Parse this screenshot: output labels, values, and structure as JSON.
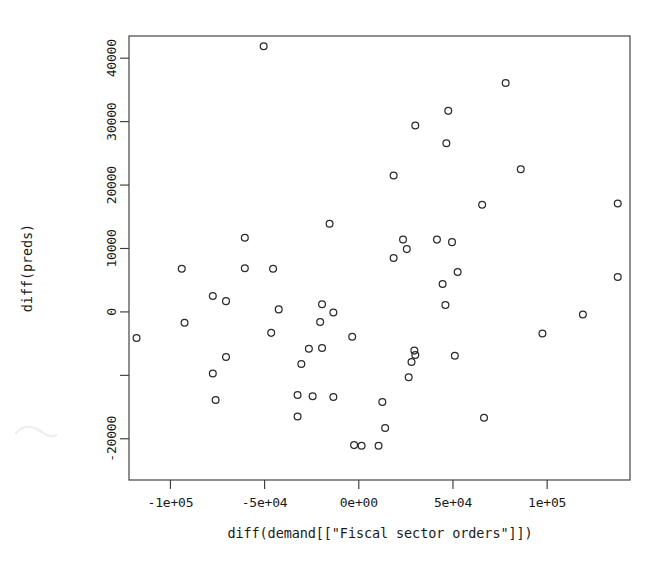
{
  "chart_data": {
    "type": "scatter",
    "title": "",
    "xlabel": "diff(demand[[\"Fiscal sector orders\"]])",
    "ylabel": "diff(preds)",
    "xlim": [
      -122000,
      144000
    ],
    "ylim": [
      -26500,
      43500
    ],
    "grid": false,
    "legend": "none",
    "marker": "open-circle",
    "marker_color": "#2b2b2b",
    "xticks": [
      -100000,
      -50000,
      0,
      50000,
      100000
    ],
    "xticklabels": [
      "-1e+05",
      "-5e+04",
      "0e+00",
      "5e+04",
      "1e+05"
    ],
    "yticks": [
      -20000,
      -10000,
      0,
      10000,
      20000,
      30000,
      40000
    ],
    "yticklabels": [
      "-20000",
      "",
      "0",
      "10000",
      "20000",
      "30000",
      "40000"
    ],
    "points": [
      {
        "x": -50500,
        "y": 41900
      },
      {
        "x": 78000,
        "y": 36100
      },
      {
        "x": 47500,
        "y": 31700
      },
      {
        "x": 30000,
        "y": 29400
      },
      {
        "x": 46500,
        "y": 26600
      },
      {
        "x": 86000,
        "y": 22500
      },
      {
        "x": 18500,
        "y": 21500
      },
      {
        "x": 65500,
        "y": 16900
      },
      {
        "x": 137500,
        "y": 17100
      },
      {
        "x": -15500,
        "y": 13900
      },
      {
        "x": -60500,
        "y": 11700
      },
      {
        "x": 23500,
        "y": 11400
      },
      {
        "x": 41500,
        "y": 11400
      },
      {
        "x": 49500,
        "y": 11000
      },
      {
        "x": 25500,
        "y": 9900
      },
      {
        "x": 18500,
        "y": 8500
      },
      {
        "x": -94000,
        "y": 6800
      },
      {
        "x": -60500,
        "y": 6900
      },
      {
        "x": -45500,
        "y": 6800
      },
      {
        "x": 52500,
        "y": 6300
      },
      {
        "x": 137500,
        "y": 5500
      },
      {
        "x": 44500,
        "y": 4400
      },
      {
        "x": -77500,
        "y": 2500
      },
      {
        "x": -70500,
        "y": 1700
      },
      {
        "x": -19500,
        "y": 1200
      },
      {
        "x": 46000,
        "y": 1100
      },
      {
        "x": -42500,
        "y": 400
      },
      {
        "x": -13500,
        "y": -100
      },
      {
        "x": 119000,
        "y": -400
      },
      {
        "x": -20500,
        "y": -1600
      },
      {
        "x": -92500,
        "y": -1700
      },
      {
        "x": -46500,
        "y": -3300
      },
      {
        "x": -3500,
        "y": -3900
      },
      {
        "x": 97500,
        "y": -3400
      },
      {
        "x": -118000,
        "y": -4100
      },
      {
        "x": -26500,
        "y": -5800
      },
      {
        "x": -19500,
        "y": -5700
      },
      {
        "x": 29500,
        "y": -6100
      },
      {
        "x": -70500,
        "y": -7100
      },
      {
        "x": 30000,
        "y": -6800
      },
      {
        "x": 51000,
        "y": -6900
      },
      {
        "x": 28000,
        "y": -7900
      },
      {
        "x": -30500,
        "y": -8200
      },
      {
        "x": -77500,
        "y": -9700
      },
      {
        "x": 26500,
        "y": -10300
      },
      {
        "x": -32500,
        "y": -13100
      },
      {
        "x": -24500,
        "y": -13300
      },
      {
        "x": -13500,
        "y": -13400
      },
      {
        "x": -76000,
        "y": -13900
      },
      {
        "x": 12500,
        "y": -14200
      },
      {
        "x": -32500,
        "y": -16500
      },
      {
        "x": 66500,
        "y": -16700
      },
      {
        "x": 14000,
        "y": -18300
      },
      {
        "x": -2500,
        "y": -21000
      },
      {
        "x": 1500,
        "y": -21100
      },
      {
        "x": 10500,
        "y": -21100
      }
    ]
  },
  "geometry": {
    "plot_left": 129,
    "plot_right": 630,
    "plot_top": 36,
    "plot_bottom": 480
  }
}
